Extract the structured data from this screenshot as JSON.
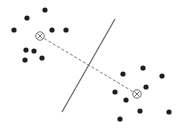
{
  "diagram": {
    "title": "",
    "width": 182,
    "height": 129,
    "colors": {
      "background": "#ffffff",
      "point": "#1f1f1f",
      "separator": "#6b6b6b",
      "connector": "#7a7a7a",
      "centroid": "#6b6b6b"
    },
    "separator_line": {
      "x1": 115,
      "y1": 19,
      "x2": 62,
      "y2": 112
    },
    "connector_line": {
      "x1": 40,
      "y1": 36,
      "x2": 137,
      "y2": 94,
      "dash": "3,2"
    },
    "centroids": [
      {
        "name": "cluster-a-centroid",
        "x": 40,
        "y": 36,
        "r": 4.2
      },
      {
        "name": "cluster-b-centroid",
        "x": 137,
        "y": 94,
        "r": 4.2
      }
    ],
    "clusters": [
      {
        "name": "cluster-a",
        "points": [
          {
            "x": 45,
            "y": 10
          },
          {
            "x": 27,
            "y": 18
          },
          {
            "x": 14,
            "y": 30
          },
          {
            "x": 52,
            "y": 30
          },
          {
            "x": 66,
            "y": 30
          },
          {
            "x": 26,
            "y": 50
          },
          {
            "x": 34,
            "y": 51
          },
          {
            "x": 25,
            "y": 60
          },
          {
            "x": 42,
            "y": 58
          }
        ]
      },
      {
        "name": "cluster-b",
        "points": [
          {
            "x": 123,
            "y": 74
          },
          {
            "x": 143,
            "y": 68
          },
          {
            "x": 162,
            "y": 76
          },
          {
            "x": 146,
            "y": 87
          },
          {
            "x": 115,
            "y": 92
          },
          {
            "x": 126,
            "y": 100
          },
          {
            "x": 140,
            "y": 111
          },
          {
            "x": 169,
            "y": 112
          },
          {
            "x": 120,
            "y": 119
          }
        ]
      }
    ],
    "point_radius": 2.6
  }
}
